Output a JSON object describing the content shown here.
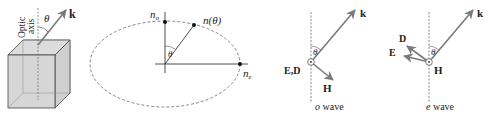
{
  "crystal": {
    "axis_label_line1": "Optic",
    "axis_label_line2": "axis",
    "angle_label": "θ",
    "wavevector_label": "k"
  },
  "ellipse": {
    "no_label_base": "n",
    "no_label_sub": "o",
    "ntheta_label": "n(θ)",
    "ne_label_base": "n",
    "ne_label_sub": "e",
    "angle_label": "θ"
  },
  "o_wave": {
    "k_label": "k",
    "angle_label": "θ",
    "ed_label": "E,D",
    "h_label": "H",
    "caption_italic": "o",
    "caption_rest": " wave"
  },
  "e_wave": {
    "k_label": "k",
    "angle_label": "θ",
    "d_label": "D",
    "e_label": "E",
    "h_label": "H",
    "caption_italic": "e",
    "caption_rest": " wave"
  },
  "colors": {
    "arrow_gray": "#7a7a7a",
    "crystal_fill": "#d9d9d9",
    "line": "#333333"
  }
}
